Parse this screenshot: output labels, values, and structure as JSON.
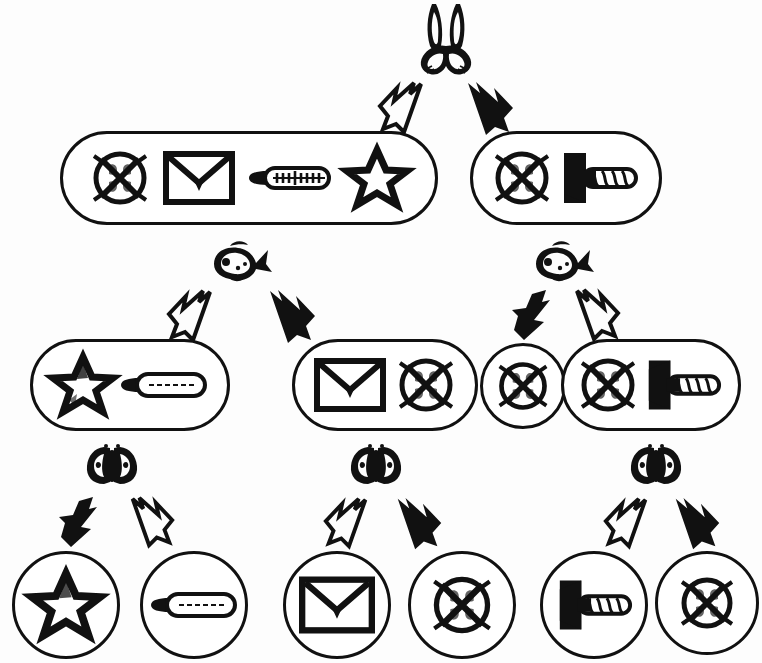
{
  "diagram": {
    "type": "tree",
    "ink_color": "#111111",
    "background_color": "#ffffff",
    "levels": 4,
    "icon_names": {
      "rabbit": "rabbit-head-icon",
      "fish": "fish-icon",
      "butterfly": "butterfly-icon",
      "circle_x": "circle-with-x-icon",
      "envelope": "envelope-icon",
      "thermometer": "thermometer-icon",
      "star": "star-icon",
      "arrow_left": "left-arrow-tool-icon",
      "arrow_white": "white-outline-arrow-icon",
      "arrow_black": "black-filled-arrow-icon"
    },
    "splitters": [
      {
        "id": "split-root",
        "icon": "rabbit",
        "left_branch": "white-arrow",
        "right_branch": "black-arrow"
      },
      {
        "id": "split-left",
        "icon": "fish",
        "left_branch": "white-arrow",
        "right_branch": "black-arrow"
      },
      {
        "id": "split-right",
        "icon": "fish",
        "left_branch": "black-arrow",
        "right_branch": "white-arrow"
      },
      {
        "id": "split-leaf-1",
        "icon": "butterfly",
        "left_branch": "black-arrow",
        "right_branch": "white-arrow"
      },
      {
        "id": "split-leaf-2",
        "icon": "butterfly",
        "left_branch": "white-arrow",
        "right_branch": "black-arrow"
      },
      {
        "id": "split-leaf-3",
        "icon": "butterfly",
        "left_branch": "white-arrow",
        "right_branch": "black-arrow"
      }
    ],
    "nodes": [
      {
        "id": "node-l2-left",
        "level": 2,
        "shape": "pill",
        "items": [
          "circle_x",
          "envelope",
          "thermometer",
          "star"
        ]
      },
      {
        "id": "node-l2-right",
        "level": 2,
        "shape": "pill",
        "items": [
          "circle_x",
          "arrow_left"
        ]
      },
      {
        "id": "node-l3-a",
        "level": 3,
        "shape": "pill",
        "items": [
          "star",
          "thermometer"
        ]
      },
      {
        "id": "node-l3-b",
        "level": 3,
        "shape": "pill",
        "items": [
          "envelope",
          "circle_x"
        ]
      },
      {
        "id": "node-l3-c",
        "level": 3,
        "shape": "circle",
        "items": [
          "circle_x"
        ]
      },
      {
        "id": "node-l3-d",
        "level": 3,
        "shape": "pill",
        "items": [
          "circle_x",
          "arrow_left"
        ]
      },
      {
        "id": "leaf-1",
        "level": 4,
        "shape": "circle",
        "items": [
          "star"
        ]
      },
      {
        "id": "leaf-2",
        "level": 4,
        "shape": "circle",
        "items": [
          "thermometer"
        ]
      },
      {
        "id": "leaf-3",
        "level": 4,
        "shape": "circle",
        "items": [
          "envelope"
        ]
      },
      {
        "id": "leaf-4",
        "level": 4,
        "shape": "circle",
        "items": [
          "circle_x"
        ]
      },
      {
        "id": "leaf-5",
        "level": 4,
        "shape": "circle",
        "items": [
          "arrow_left"
        ]
      },
      {
        "id": "leaf-6",
        "level": 4,
        "shape": "circle",
        "items": [
          "circle_x"
        ]
      }
    ]
  }
}
